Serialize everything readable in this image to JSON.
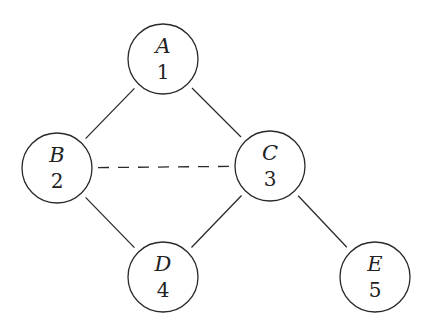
{
  "graph": {
    "node_radius": 35,
    "nodes": [
      {
        "id": "A",
        "label": "A",
        "value": "1",
        "cx": 163,
        "cy": 59
      },
      {
        "id": "B",
        "label": "B",
        "value": "2",
        "cx": 57,
        "cy": 168
      },
      {
        "id": "C",
        "label": "C",
        "value": "3",
        "cx": 270,
        "cy": 166
      },
      {
        "id": "D",
        "label": "D",
        "value": "4",
        "cx": 163,
        "cy": 277
      },
      {
        "id": "E",
        "label": "E",
        "value": "5",
        "cx": 375,
        "cy": 277
      }
    ],
    "edges": [
      {
        "from": "A",
        "to": "B",
        "style": "solid"
      },
      {
        "from": "A",
        "to": "C",
        "style": "solid"
      },
      {
        "from": "B",
        "to": "C",
        "style": "dashed"
      },
      {
        "from": "B",
        "to": "D",
        "style": "solid"
      },
      {
        "from": "C",
        "to": "D",
        "style": "solid"
      },
      {
        "from": "C",
        "to": "E",
        "style": "solid"
      }
    ]
  }
}
